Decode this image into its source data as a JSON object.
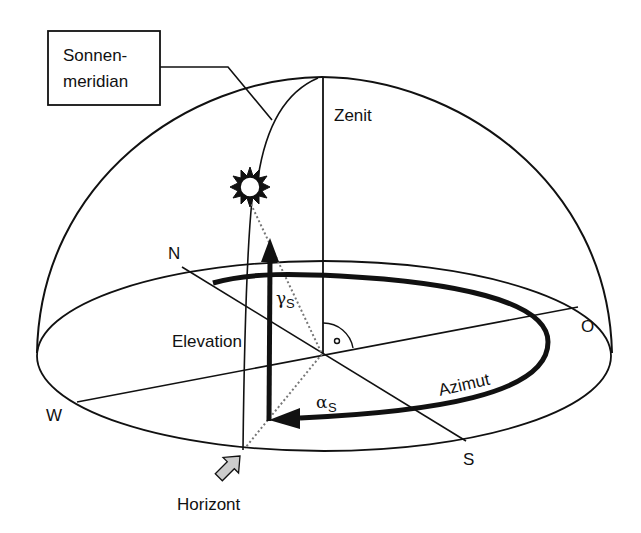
{
  "diagram": {
    "callout_box": {
      "line1": "Sonnen-",
      "line2": "meridian"
    },
    "labels": {
      "zenith": "Zenit",
      "north": "N",
      "east": "O",
      "west": "W",
      "south": "S",
      "elevation": "Elevation",
      "azimuth": "Azimut",
      "horizon": "Horizont"
    },
    "angles": {
      "elevation_symbol": "γ",
      "elevation_subscript": "S",
      "azimuth_symbol": "α",
      "azimuth_subscript": "S"
    },
    "icons": [
      "sun-icon",
      "right-angle-marker-icon",
      "horizon-pointer-arrow-icon"
    ],
    "colors": {
      "line": "#111111",
      "pointer_fill": "#cccccc",
      "dotted": "#888888"
    }
  }
}
